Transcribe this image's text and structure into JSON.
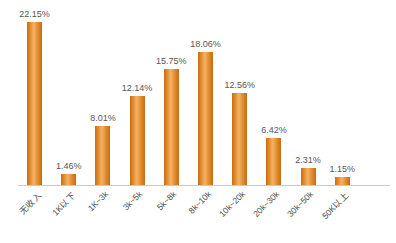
{
  "chart_data": {
    "type": "bar",
    "title": "",
    "subtitle": "",
    "xlabel": "",
    "ylabel": "",
    "grid": false,
    "legend": null,
    "value_suffix": "%",
    "ylim": [
      0,
      24
    ],
    "categories": [
      "无收入",
      "1K以下",
      "1K~3k",
      "3k~5k",
      "5k~8k",
      "8k~10k",
      "10k~20k",
      "20k~30k",
      "30k~50k",
      "50K以上"
    ],
    "values": [
      22.15,
      1.46,
      8.01,
      12.14,
      15.75,
      18.06,
      12.56,
      6.42,
      2.31,
      1.15
    ],
    "value_labels": [
      "22.15%",
      "1.46%",
      "8.01%",
      "12.14%",
      "15.75%",
      "18.06%",
      "12.56%",
      "6.42%",
      "2.31%",
      "1.15%"
    ],
    "colors": {
      "bar_edge": "#c96f14",
      "bar_mid": "#f4b268",
      "bar_base": "#e08a2e",
      "axis_line": "#c9c9c9",
      "value_text": "#565656",
      "category_text": "#4a4a4a",
      "background": "#ffffff"
    }
  }
}
